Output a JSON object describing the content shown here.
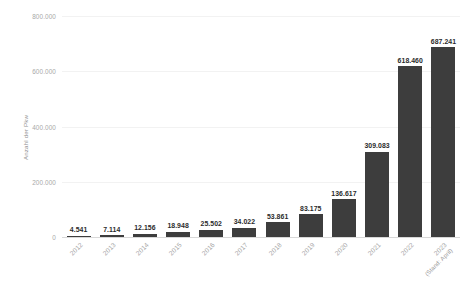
{
  "chart_data": {
    "type": "bar",
    "title": "",
    "subtitle": "",
    "xlabel": "",
    "ylabel": "Anzahl der Pkw",
    "categories": [
      "2012",
      "2013",
      "2014",
      "2015",
      "2016",
      "2017",
      "2018",
      "2019",
      "2020",
      "2021",
      "2022",
      "2023"
    ],
    "category_sublabels": [
      "",
      "",
      "",
      "",
      "",
      "",
      "",
      "",
      "",
      "",
      "",
      "(Stand: April)"
    ],
    "values": [
      4541,
      7114,
      12156,
      18948,
      25502,
      34022,
      53861,
      83175,
      136617,
      309083,
      618460,
      687241
    ],
    "value_labels": [
      "4.541",
      "7.114",
      "12.156",
      "18.948",
      "25.502",
      "34.022",
      "53.861",
      "83.175",
      "136.617",
      "309.083",
      "618.460",
      "687.241"
    ],
    "ylim": [
      0,
      800000
    ],
    "yticks": [
      0,
      200000,
      400000,
      600000,
      800000
    ],
    "ytick_labels": [
      "0",
      "200.000",
      "400.000",
      "600.000",
      "800.000"
    ],
    "grid": true,
    "legend": false,
    "bar_color": "#3d3d3d",
    "gridline_color": "#f2f2f2",
    "axis_color": "#d8d8d8",
    "background_color": "#ffffff",
    "tick_label_color": "#a8a8a8",
    "value_label_color": "#2b2b2b"
  }
}
